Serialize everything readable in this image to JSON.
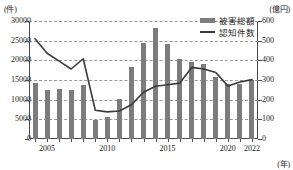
{
  "chart_data": {
    "type": "bar",
    "title": "",
    "subtitle": "",
    "xlabel": "(年)",
    "ylabel": "(件)",
    "ylabel_right": "(億円)",
    "grid": true,
    "legend_position": "top-right",
    "categories": [
      2004,
      2005,
      2006,
      2007,
      2008,
      2009,
      2010,
      2011,
      2012,
      2013,
      2014,
      2015,
      2016,
      2017,
      2018,
      2019,
      2020,
      2021,
      2022
    ],
    "tick_labels_x": [
      "2005",
      "2010",
      "2015",
      "2020",
      "2022"
    ],
    "tick_values_x": [
      2005,
      2010,
      2015,
      2020,
      2022
    ],
    "ylim": [
      0,
      30000
    ],
    "yticks": [
      0,
      5000,
      10000,
      15000,
      20000,
      25000,
      30000
    ],
    "ytick_labels": [
      "0",
      "5000",
      "10000",
      "15000",
      "20000",
      "25000",
      "30000"
    ],
    "ylim_right": [
      0,
      600
    ],
    "yticks_right": [
      0,
      100,
      200,
      300,
      400,
      500,
      600
    ],
    "ytick_labels_right": [
      "0",
      "100",
      "200",
      "300",
      "400",
      "500",
      "600"
    ],
    "series": [
      {
        "name": "被害総額",
        "kind": "bar",
        "axis": "right",
        "unit": "億円",
        "color": "#7c7c7c",
        "values": [
          284,
          250,
          254,
          250,
          275,
          95,
          113,
          203,
          364,
          490,
          565,
          482,
          407,
          394,
          382,
          316,
          278,
          282,
          300
        ]
      },
      {
        "name": "認知件数",
        "kind": "line",
        "axis": "left",
        "unit": "件",
        "color": "#3a3a3a",
        "values": [
          25500,
          21800,
          19800,
          17800,
          20400,
          7300,
          6900,
          7100,
          8700,
          11900,
          13400,
          13800,
          14200,
          18200,
          17800,
          16900,
          13500,
          14500,
          15100
        ]
      }
    ]
  },
  "legend": {
    "items": [
      {
        "label": "被害総額",
        "marker": "bar-swatch"
      },
      {
        "label": "認知件数",
        "marker": "line-swatch"
      }
    ]
  }
}
